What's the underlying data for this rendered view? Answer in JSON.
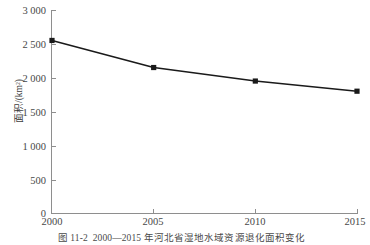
{
  "chart_data": {
    "type": "line",
    "title": "",
    "xlabel": "",
    "ylabel": "面积/(km²)",
    "categories": [
      "2000",
      "2005",
      "2010",
      "2015"
    ],
    "x": [
      2000,
      2005,
      2010,
      2015
    ],
    "values": [
      2550,
      2150,
      1950,
      1800
    ],
    "series": [
      {
        "name": "湿地水域资源退化面积",
        "values": [
          2550,
          2150,
          1950,
          1800
        ]
      }
    ],
    "ylim": [
      0,
      3000
    ],
    "xlim": [
      2000,
      2015
    ],
    "yticks": [
      0,
      500,
      1000,
      1500,
      2000,
      2500,
      3000
    ],
    "ytick_labels": [
      "0",
      "500",
      "1 000",
      "1 500",
      "2 000",
      "2 500",
      "3 000"
    ],
    "xticks": [
      2000,
      2005,
      2010,
      2015
    ],
    "xtick_labels": [
      "2000",
      "2005",
      "2010",
      "2015"
    ],
    "grid": false,
    "legend": false,
    "marker": "square",
    "line_color": "#1a1a1a",
    "marker_color": "#1a1a1a",
    "axis_color": "#8e8e8e",
    "background": "#ffffff"
  },
  "axes": {
    "y_title": "面积/(km²)",
    "y_tick_labels": [
      "3 000",
      "2 500",
      "2 000",
      "1 500",
      "1 000",
      "500",
      "0"
    ],
    "x_tick_labels": [
      "2000",
      "2005",
      "2010",
      "2015"
    ]
  },
  "caption": {
    "text": "图 11-2  2000—2015 年河北省湿地水域资源退化面积变化",
    "figure_number": "图 11-2",
    "period": "2000—2015"
  }
}
